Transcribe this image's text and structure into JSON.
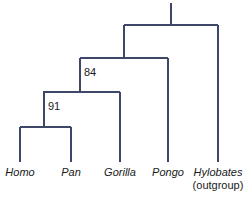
{
  "figure": {
    "type": "cladogram",
    "background_color": "#ffffff",
    "line_color": "#3f4768",
    "text_color": "#1a1a1a",
    "line_width": 2
  },
  "taxa": [
    {
      "name": "Homo",
      "label": "Homo",
      "sub": "",
      "x": 20,
      "italic": true
    },
    {
      "name": "Pan",
      "label": "Pan",
      "sub": "",
      "x": 71,
      "italic": true
    },
    {
      "name": "Gorilla",
      "label": "Gorilla",
      "sub": "",
      "x": 120,
      "italic": true
    },
    {
      "name": "Pongo",
      "label": "Pongo",
      "sub": "",
      "x": 168,
      "italic": true
    },
    {
      "name": "Hylobates",
      "label": "Hylobates",
      "sub": "(outgroup)",
      "x": 218,
      "italic": true
    }
  ],
  "support_values": [
    {
      "node": "homo-pan-clade",
      "value": "91",
      "x": 48,
      "y": 101
    },
    {
      "node": "homo-pan-gorilla-clade",
      "value": "84",
      "x": 84,
      "y": 67
    }
  ],
  "nodes": [
    {
      "name": "root",
      "x": 171,
      "y": 25,
      "stem_top": 3
    },
    {
      "name": "great-ape-gibbon-split",
      "x": 171,
      "y": 25,
      "left": 124,
      "right": 218
    },
    {
      "name": "african-ape-pongo-split",
      "x": 124,
      "y": 58,
      "left": 80,
      "right": 168
    },
    {
      "name": "homo-pan-gorilla-split",
      "x": 80,
      "y": 92,
      "left": 43,
      "right": 120
    },
    {
      "name": "homo-pan-split",
      "x": 44,
      "y": 127,
      "left": 20,
      "right": 71
    }
  ],
  "tip_baseline_y": 162,
  "label_top_y": 166
}
